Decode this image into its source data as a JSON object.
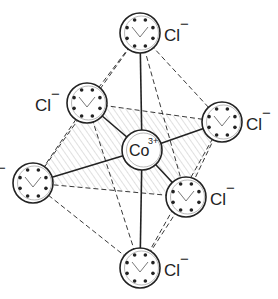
{
  "diagram": {
    "title": "Octahedral [CoCl6]3- complex ion",
    "center_ion": {
      "label": "Co",
      "charge": "3+",
      "x": 142,
      "y": 150,
      "r": 20
    },
    "ligands": [
      {
        "id": "top",
        "label": "Cl",
        "charge": "−",
        "x": 140,
        "y": 33,
        "r": 20,
        "label_dx": 24,
        "label_dy": 8
      },
      {
        "id": "upper-left",
        "label": "Cl",
        "charge": "−",
        "x": 87,
        "y": 103,
        "r": 20,
        "label_dx": -52,
        "label_dy": 8
      },
      {
        "id": "right",
        "label": "Cl",
        "charge": "−",
        "x": 222,
        "y": 122,
        "r": 20,
        "label_dx": 24,
        "label_dy": 8
      },
      {
        "id": "left",
        "label": "Cl",
        "charge": "−",
        "x": 33,
        "y": 183,
        "r": 20,
        "label_dx": -52,
        "label_dy": 2
      },
      {
        "id": "lower-right",
        "label": "Cl",
        "charge": "−",
        "x": 186,
        "y": 197,
        "r": 20,
        "label_dx": 24,
        "label_dy": 8
      },
      {
        "id": "bottom",
        "label": "Cl",
        "charge": "−",
        "x": 140,
        "y": 268,
        "r": 20,
        "label_dx": 24,
        "label_dy": 8
      }
    ],
    "colors": {
      "line": "#222222",
      "hatch": "#bbbbbb",
      "background": "#ffffff"
    }
  }
}
